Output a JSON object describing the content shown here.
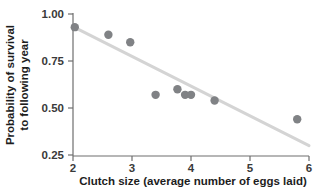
{
  "chart_data": {
    "type": "scatter",
    "title": "",
    "subtitle": "",
    "xlabel": "Clutch size (average number of eggs laid)",
    "ylabel": "Probability of survival to following year",
    "ylabel_line1": "Probability of survival",
    "ylabel_line2": "to following year",
    "xlim": [
      2,
      6
    ],
    "ylim": [
      0.25,
      1.0
    ],
    "xticks": [
      2,
      3,
      4,
      5,
      6
    ],
    "xtick_labels": [
      "2",
      "3",
      "4",
      "5",
      "6"
    ],
    "yticks": [
      0.25,
      0.5,
      0.75,
      1.0
    ],
    "ytick_labels": [
      "0.25",
      "0.50",
      "0.75",
      "1.00"
    ],
    "grid": false,
    "legend": null,
    "legend_position": "none",
    "marker": "circle",
    "marker_color": "#808285",
    "marker_size": 5,
    "x": [
      2.03,
      2.6,
      2.97,
      3.4,
      3.77,
      3.9,
      4.0,
      4.4,
      5.8
    ],
    "y": [
      0.93,
      0.89,
      0.85,
      0.57,
      0.6,
      0.57,
      0.57,
      0.54,
      0.44
    ],
    "points": [
      {
        "x": 2.03,
        "y": 0.93
      },
      {
        "x": 2.6,
        "y": 0.89
      },
      {
        "x": 2.97,
        "y": 0.85
      },
      {
        "x": 3.4,
        "y": 0.57
      },
      {
        "x": 3.77,
        "y": 0.6
      },
      {
        "x": 3.9,
        "y": 0.57
      },
      {
        "x": 4.0,
        "y": 0.57
      },
      {
        "x": 4.4,
        "y": 0.54
      },
      {
        "x": 5.8,
        "y": 0.44
      }
    ],
    "trendline": {
      "type": "linear",
      "color": "#d4d4d4",
      "width": 3,
      "x_start": 2.05,
      "y_start": 0.925,
      "x_end": 6.0,
      "y_end": 0.3
    },
    "axis_color": "#6e6e6e",
    "text_color": "#1d1d1d",
    "background": "#ffffff"
  }
}
